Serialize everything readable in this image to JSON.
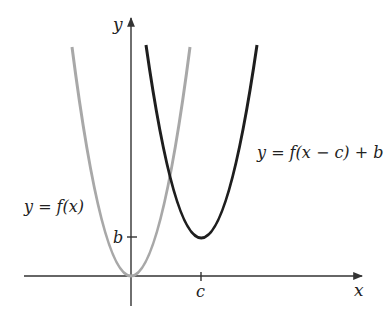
{
  "diagram": {
    "axes": {
      "x_label": "x",
      "y_label": "y"
    },
    "ticks": {
      "b_label": "b",
      "c_label": "c"
    },
    "curves": [
      {
        "name": "original",
        "label": "y = f(x)",
        "color": "#a8a8a8",
        "vertex": [
          0,
          0
        ]
      },
      {
        "name": "translated",
        "label": "y = f(x − c) + b",
        "color": "#1e1e1e",
        "vertex": [
          "c",
          "b"
        ]
      }
    ],
    "colors": {
      "axis": "#333333",
      "original_curve": "#a8a8a8",
      "translated_curve": "#1e1e1e"
    }
  }
}
